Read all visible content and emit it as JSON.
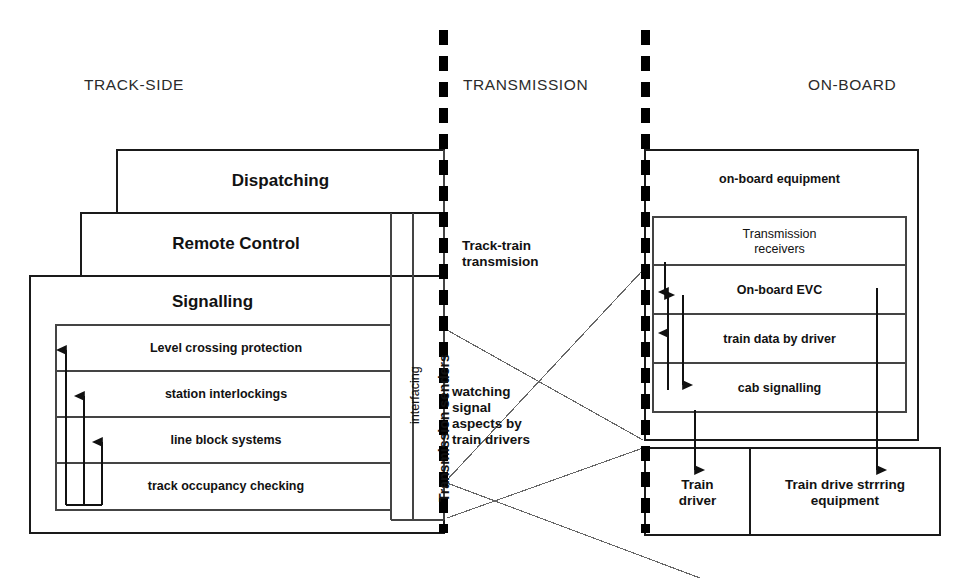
{
  "diagram": {
    "columns": [
      {
        "id": "track-side",
        "label": "TRACK-SIDE"
      },
      {
        "id": "transmission",
        "label": "TRANSMISSION"
      },
      {
        "id": "on-board",
        "label": "ON-BOARD"
      }
    ],
    "colors": {
      "stroke": "#1a1a1a",
      "thin_stroke": "#555555",
      "divider": "#000000",
      "background": "#ffffff",
      "text": "#121212"
    },
    "track_side": {
      "dispatching": "Dispatching",
      "remote_control": "Remote Control",
      "signalling": "Signalling",
      "signalling_functions": [
        "Level crossing protection",
        "station interlockings",
        "line block systems",
        "track occupancy checking"
      ],
      "interfacing": "interfacing",
      "transmission_senders": "Transmission senders"
    },
    "transmission": {
      "track_train": "Track-train\ntransmision",
      "watching": "watching\nsignal\naspects by\ntrain drivers"
    },
    "on_board": {
      "equipment": "on-board equipment",
      "items": [
        "Transmission\nreceivers",
        "On-board EVC",
        "train data by driver",
        "cab signalling"
      ],
      "train_driver": "Train\ndriver",
      "steering_equipment": "Train drive strrring\nequipment"
    }
  }
}
